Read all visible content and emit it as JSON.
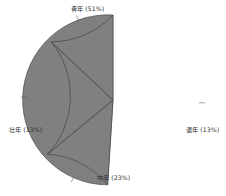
{
  "chart_data": {
    "type": "pie",
    "title": "",
    "subtitle": "",
    "xlabel": "",
    "ylabel": "",
    "legend": "none",
    "grid": false,
    "labels_position": "outside",
    "slice_fill_color": "#808080",
    "slice_edge_color": "#3c3c3c",
    "background_color": "#ffffff",
    "leader_line_color": "#555555",
    "start_angle_deg": 90,
    "direction": "clockwise",
    "categories": [
      "青年",
      "退年",
      "中年",
      "壮年"
    ],
    "values": [
      51,
      23,
      13,
      13
    ],
    "slices": [
      {
        "name": "青年",
        "percent": 51,
        "label": "青年 (51%)",
        "position": "top"
      },
      {
        "name": "退年",
        "percent": 13,
        "label": "退年 (13%)",
        "position": "right"
      },
      {
        "name": "中年",
        "percent": 23,
        "label": "中年 (23%)",
        "position": "bottom"
      },
      {
        "name": "壮年",
        "percent": 13,
        "label": "壮年 (13%)",
        "position": "left"
      }
    ]
  }
}
